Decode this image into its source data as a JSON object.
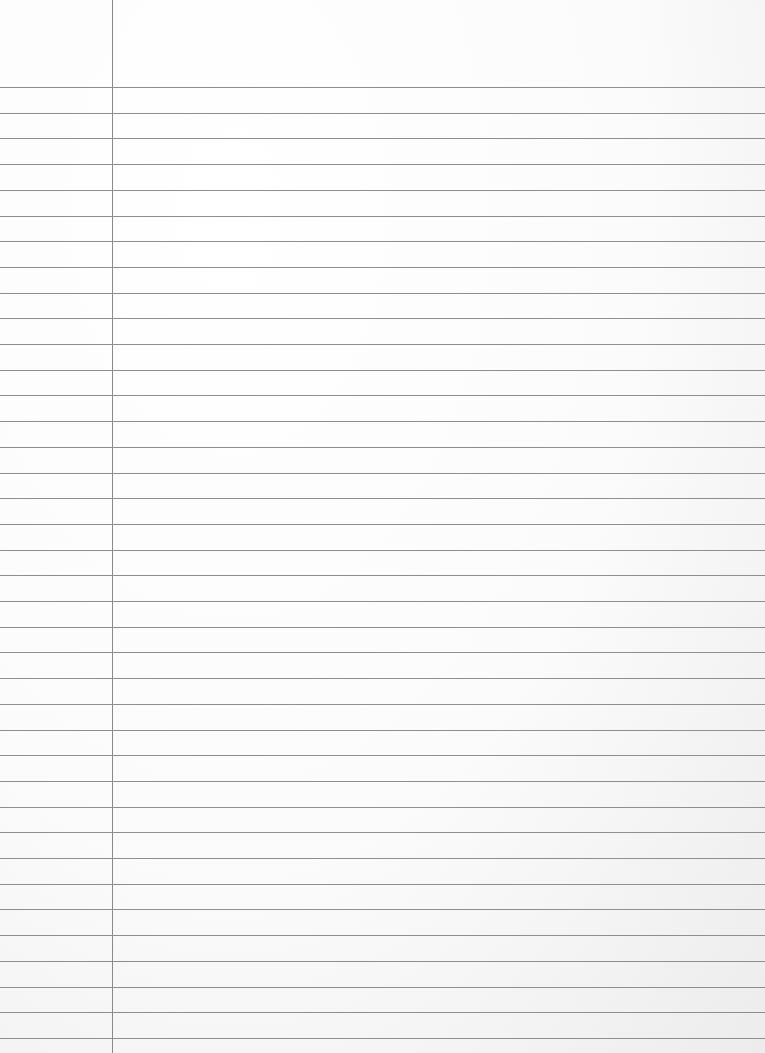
{
  "page": {
    "type": "ruled-notebook-paper",
    "background_color": "#fbfbfb",
    "rule_color": "#8e8e8e",
    "margin_line_color": "#8a8a8a",
    "margin_line_x": 112,
    "first_rule_y": 87,
    "rule_spacing": 25.7,
    "rule_count": 38,
    "text": ""
  }
}
